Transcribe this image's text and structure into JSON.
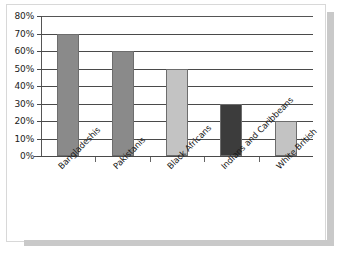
{
  "chart_data": {
    "type": "bar",
    "title": "",
    "subtitle": "",
    "xlabel": "",
    "ylabel": "",
    "categories": [
      "Bangladeshis",
      "Pakistanis",
      "Black Africans",
      "Indians and Caribbeans",
      "White British"
    ],
    "values": [
      70,
      60,
      50,
      30,
      20
    ],
    "value_unit": "%",
    "ylim": [
      0,
      80
    ],
    "ytick_step": 10,
    "ytick_labels": [
      "0%",
      "10%",
      "20%",
      "30%",
      "40%",
      "50%",
      "60%",
      "70%",
      "80%"
    ],
    "ytick_values": [
      0,
      10,
      20,
      30,
      40,
      50,
      60,
      70,
      80
    ],
    "grid": true,
    "grid_axis": "y",
    "legend": false,
    "legend_position": "none",
    "bar_colors": [
      "#8a8a8a",
      "#8a8a8a",
      "#c3c3c3",
      "#3c3c3c",
      "#c3c3c3"
    ],
    "bar_border_color": "#6d6d6d",
    "axis_color": "#555555",
    "gridline_color": "#4a4a4a",
    "plot_background": "#ffffff",
    "series": [
      {
        "name": "",
        "values": [
          70,
          60,
          50,
          30,
          20
        ]
      }
    ],
    "points": [
      {
        "category": "Bangladeshis",
        "value": 70,
        "label": "70%",
        "color": "#8a8a8a"
      },
      {
        "category": "Pakistanis",
        "value": 60,
        "label": "60%",
        "color": "#8a8a8a"
      },
      {
        "category": "Black Africans",
        "value": 50,
        "label": "50%",
        "color": "#c3c3c3"
      },
      {
        "category": "Indians and Caribbeans",
        "value": 30,
        "label": "30%",
        "color": "#3c3c3c"
      },
      {
        "category": "White British",
        "value": 20,
        "label": "20%",
        "color": "#c3c3c3"
      }
    ]
  },
  "caption": {
    "text": ""
  }
}
